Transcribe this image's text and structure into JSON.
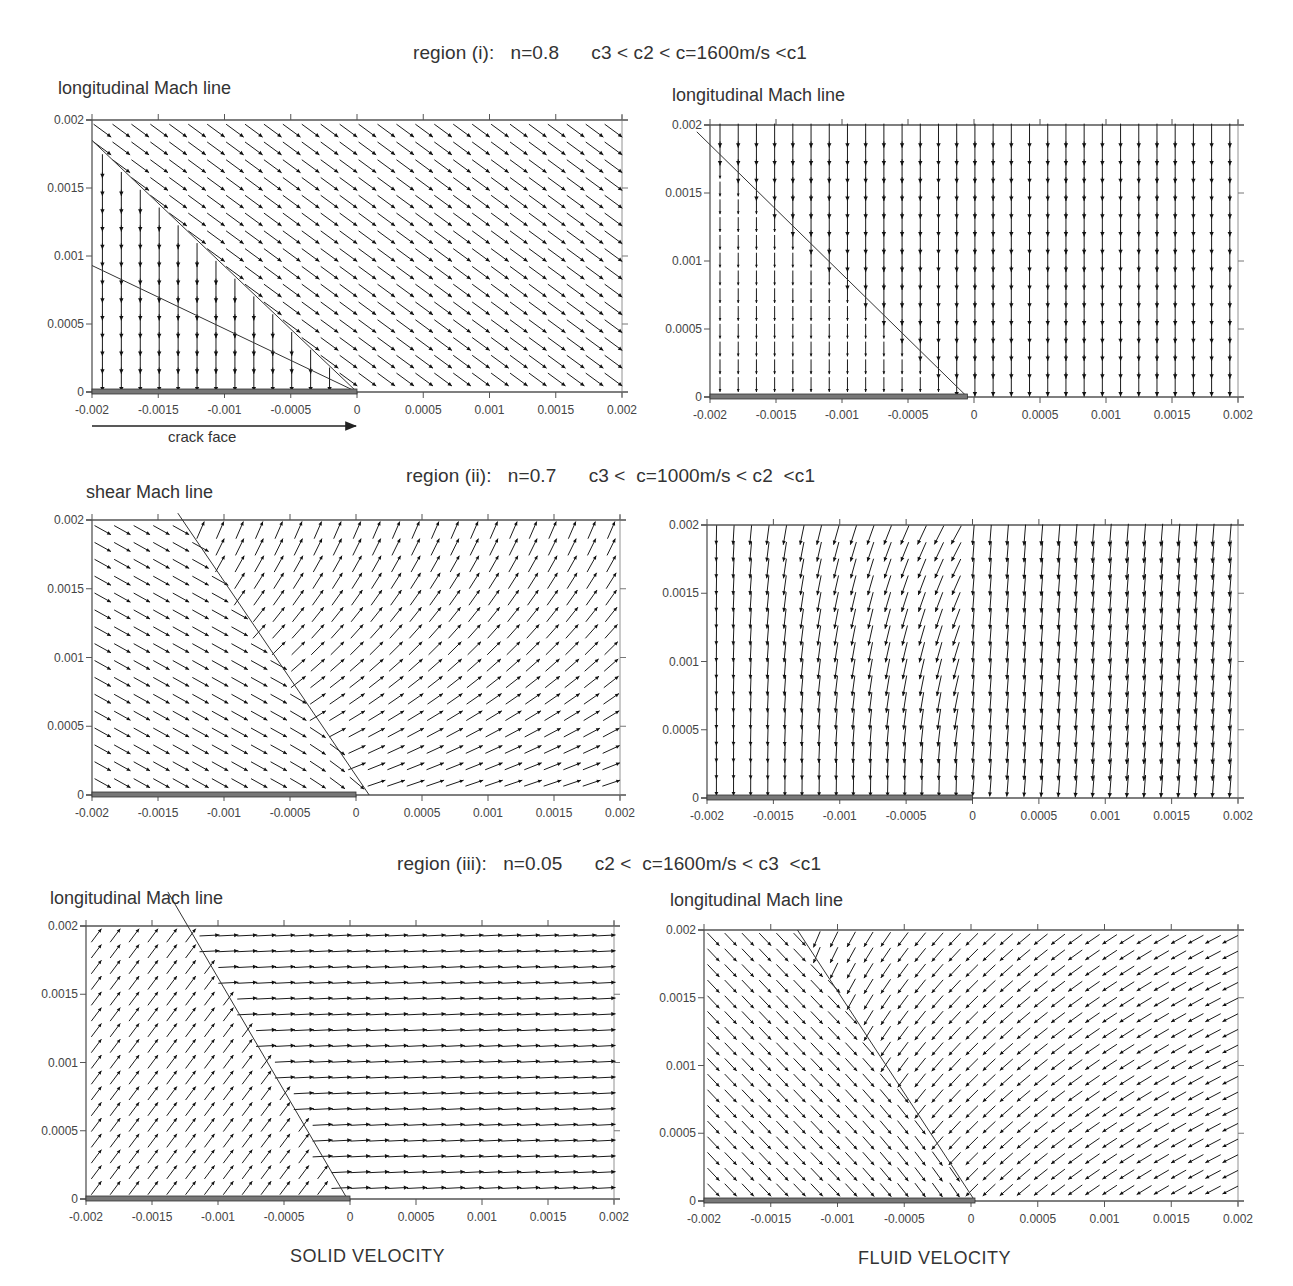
{
  "figure": {
    "footer": {
      "left": "SOLID VELOCITY",
      "right": "FLUID VELOCITY"
    },
    "crack_face_label": "crack face"
  },
  "regions": [
    {
      "title": "region (i):   n=0.8      c3 < c2 < c=1600m/s <c1",
      "n": 0.8,
      "c": "1600m/s",
      "ordering": "c3 < c2 < c < c1"
    },
    {
      "title": "region (ii):   n=0.7      c3 <  c=1000m/s < c2  <c1",
      "n": 0.7,
      "c": "1000m/s",
      "ordering": "c3 < c < c2 < c1"
    },
    {
      "title": "region (iii):   n=0.05      c2 <  c=1600m/s < c3  <c1",
      "n": 0.05,
      "c": "1600m/s",
      "ordering": "c2 < c < c3 < c1"
    }
  ],
  "chart_data": [
    {
      "type": "quiver",
      "id": "r1-solid",
      "region": "region (i)",
      "quantity": "SOLID VELOCITY",
      "annotation": "longitudinal Mach line",
      "xlim": [
        -0.002,
        0.002
      ],
      "ylim": [
        0,
        0.002
      ],
      "xticks": [
        "-0.002",
        "-0.0015",
        "-0.001",
        "-0.0005",
        "0",
        "0.0005",
        "0.001",
        "0.0015",
        "0.002"
      ],
      "yticks": [
        "0",
        "0.0005",
        "0.001",
        "0.0015",
        "0.002"
      ],
      "mach_lines": [
        {
          "from": [
            -0.002,
            0.00185
          ],
          "to": [
            0,
            0
          ]
        },
        {
          "from": [
            -0.002,
            0.00093
          ],
          "to": [
            0,
            0
          ]
        }
      ],
      "crack_face": [
        -0.002,
        0
      ],
      "field": "r1solid",
      "grid": {
        "nx": 28,
        "ny": 15
      }
    },
    {
      "type": "quiver",
      "id": "r1-fluid",
      "region": "region (i)",
      "quantity": "FLUID VELOCITY",
      "annotation": "longitudinal Mach line",
      "xlim": [
        -0.002,
        0.002
      ],
      "ylim": [
        0,
        0.002
      ],
      "xticks": [
        "-0.002",
        "-0.0015",
        "-0.001",
        "-0.0005",
        "0",
        "0.0005",
        "0.001",
        "0.0015",
        "0.002"
      ],
      "yticks": [
        "0",
        "0.0005",
        "0.001",
        "0.0015",
        "0.002"
      ],
      "mach_lines": [
        {
          "from": [
            -0.0021,
            0.00195
          ],
          "to": [
            -5e-05,
            0
          ]
        }
      ],
      "crack_face": [
        -0.002,
        -5e-05
      ],
      "field": "r1fluid",
      "grid": {
        "nx": 29,
        "ny": 15
      }
    },
    {
      "type": "quiver",
      "id": "r2-solid",
      "region": "region (ii)",
      "quantity": "SOLID VELOCITY",
      "annotation": "shear Mach line",
      "xlim": [
        -0.002,
        0.002
      ],
      "ylim": [
        0,
        0.002
      ],
      "xticks": [
        "-0.002",
        "-0.0015",
        "-0.001",
        "-0.0005",
        "0",
        "0.0005",
        "0.001",
        "0.0015",
        "0.002"
      ],
      "yticks": [
        "0",
        "0.0005",
        "0.001",
        "0.0015",
        "0.002"
      ],
      "mach_lines": [
        {
          "from": [
            -0.00135,
            0.00205
          ],
          "to": [
            0.0001,
            0
          ]
        }
      ],
      "crack_face": [
        -0.002,
        0
      ],
      "field": "r2solid",
      "grid": {
        "nx": 27,
        "ny": 16
      }
    },
    {
      "type": "quiver",
      "id": "r2-fluid",
      "region": "region (ii)",
      "quantity": "FLUID VELOCITY",
      "annotation": "",
      "xlim": [
        -0.002,
        0.002
      ],
      "ylim": [
        0,
        0.002
      ],
      "xticks": [
        "-0.002",
        "-0.0015",
        "-0.001",
        "-0.0005",
        "0",
        "0.0005",
        "0.001",
        "0.0015",
        "0.002"
      ],
      "yticks": [
        "0",
        "0.0005",
        "0.001",
        "0.0015",
        "0.002"
      ],
      "mach_lines": [],
      "crack_face": [
        -0.002,
        0
      ],
      "field": "r2fluid",
      "grid": {
        "nx": 31,
        "ny": 16
      }
    },
    {
      "type": "quiver",
      "id": "r3-solid",
      "region": "region (iii)",
      "quantity": "SOLID VELOCITY",
      "annotation": "longitudinal Mach line",
      "xlim": [
        -0.002,
        0.002
      ],
      "ylim": [
        0,
        0.002
      ],
      "xticks": [
        "-0.002",
        "-0.0015",
        "-0.001",
        "-0.0005",
        "0",
        "0.0005",
        "0.001",
        "0.0015",
        "0.002"
      ],
      "yticks": [
        "0",
        "0.0005",
        "0.001",
        "0.0015",
        "0.002"
      ],
      "mach_lines": [
        {
          "from": [
            -0.00138,
            0.00225
          ],
          "to": [
            -2e-05,
            0
          ]
        }
      ],
      "crack_face": [
        -0.002,
        0
      ],
      "field": "r3solid",
      "grid": {
        "nx": 28,
        "ny": 17
      }
    },
    {
      "type": "quiver",
      "id": "r3-fluid",
      "region": "region (iii)",
      "quantity": "FLUID VELOCITY",
      "annotation": "longitudinal Mach line",
      "xlim": [
        -0.002,
        0.002
      ],
      "ylim": [
        0,
        0.002
      ],
      "xticks": [
        "-0.002",
        "-0.0015",
        "-0.001",
        "-0.0005",
        "0",
        "0.0005",
        "0.001",
        "0.0015",
        "0.002"
      ],
      "yticks": [
        "0",
        "0.0005",
        "0.001",
        "0.0015",
        "0.002"
      ],
      "mach_lines": [
        {
          "from": [
            -0.0013,
            0.002
          ],
          "to": [
            3e-05,
            0
          ]
        }
      ],
      "crack_face": [
        -0.002,
        3e-05
      ],
      "field": "r3fluid",
      "grid": {
        "nx": 31,
        "ny": 17
      }
    }
  ]
}
